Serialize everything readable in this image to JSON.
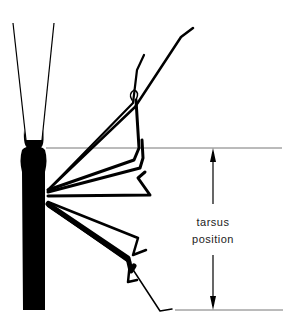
{
  "figure": {
    "type": "line-drawing",
    "labels": {
      "line1": "tarsus",
      "line2": "position"
    },
    "colors": {
      "ink": "#000000",
      "guide_line": "#777777",
      "background": "#ffffff"
    },
    "annotations": {
      "range_arrow": "double-headed vertical arrow spanning top and bottom guide lines",
      "top_guide_y": 148,
      "bottom_guide_y": 310
    }
  }
}
